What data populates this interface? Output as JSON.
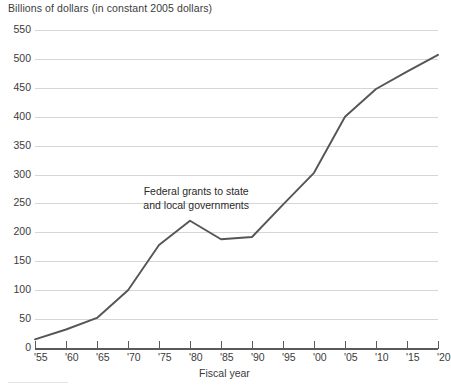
{
  "chart_data": {
    "type": "line",
    "title": "",
    "ylabel": "Billions of dollars (in constant 2005 dollars)",
    "xlabel": "Fiscal year",
    "grid": true,
    "legend": "none",
    "series_label": "Federal grants to state\nand local governments",
    "annotations": [
      {
        "text": "Federal grants to state\nand local governments",
        "x_year": 1981,
        "y_value": 270
      }
    ],
    "xlim": [
      1955,
      2020
    ],
    "ylim": [
      0,
      550
    ],
    "ytick_step": 50,
    "xtick_step": 5,
    "ytick_labels": [
      "0",
      "50",
      "100",
      "150",
      "200",
      "250",
      "300",
      "350",
      "400",
      "450",
      "500",
      "550"
    ],
    "ytick_values": [
      0,
      50,
      100,
      150,
      200,
      250,
      300,
      350,
      400,
      450,
      500,
      550
    ],
    "xtick_labels": [
      "'55",
      "'60",
      "'65",
      "'70",
      "'75",
      "'80",
      "'85",
      "'90",
      "'95",
      "'00",
      "'05",
      "'10",
      "'15",
      "'20"
    ],
    "xtick_values": [
      1955,
      1960,
      1965,
      1970,
      1975,
      1980,
      1985,
      1990,
      1995,
      2000,
      2005,
      2010,
      2015,
      2020
    ],
    "x": [
      1955,
      1960,
      1965,
      1970,
      1975,
      1980,
      1985,
      1990,
      1995,
      2000,
      2005,
      2010,
      2015,
      2020
    ],
    "values": [
      15,
      32,
      52,
      100,
      178,
      220,
      188,
      192,
      248,
      303,
      400,
      448,
      478,
      507
    ],
    "series": [
      {
        "name": "Federal grants to state and local governments",
        "values": [
          15,
          32,
          52,
          100,
          178,
          220,
          188,
          192,
          248,
          303,
          400,
          448,
          478,
          507
        ]
      }
    ],
    "colors": {
      "line": "#555555",
      "grid": "#d6d6d6",
      "axis": "#5a5a5a",
      "text": "#3b3b3b"
    }
  }
}
